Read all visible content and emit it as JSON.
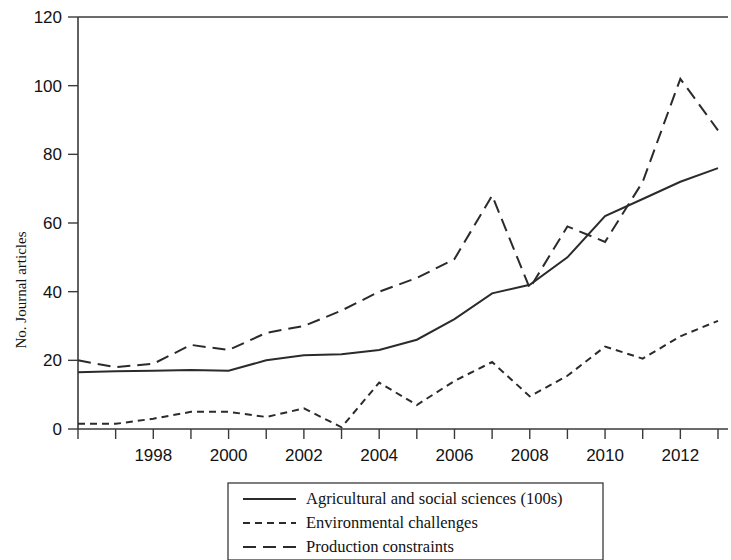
{
  "chart_data": {
    "type": "line",
    "title": "",
    "subtitle": "",
    "xlabel": "",
    "ylabel": "No. Journal articles",
    "xlim": [
      1996,
      2013
    ],
    "ylim": [
      0,
      120
    ],
    "grid": false,
    "legend_position": "bottom-center",
    "y_ticks": [
      0,
      20,
      40,
      60,
      80,
      100,
      120
    ],
    "y_tick_labels": [
      "0",
      "20",
      "40",
      "60",
      "80",
      "100",
      "120"
    ],
    "x_ticks": [
      1996,
      1997,
      1998,
      1999,
      2000,
      2001,
      2002,
      2003,
      2004,
      2005,
      2006,
      2007,
      2008,
      2009,
      2010,
      2011,
      2012,
      2013
    ],
    "x_tick_labels_shown": [
      "1998",
      "2000",
      "2002",
      "2004",
      "2006",
      "2008",
      "2010",
      "2012"
    ],
    "x_tick_labels_shown_values": [
      1998,
      2000,
      2002,
      2004,
      2006,
      2008,
      2010,
      2012
    ],
    "x": [
      1996,
      1997,
      1998,
      1999,
      2000,
      2001,
      2002,
      2003,
      2004,
      2005,
      2006,
      2007,
      2008,
      2009,
      2010,
      2011,
      2012,
      2013
    ],
    "series": [
      {
        "name": "Agricultural and social sciences (100s)",
        "style": "solid",
        "values": [
          16.5,
          16.8,
          17.0,
          17.2,
          17.0,
          20.0,
          21.5,
          21.8,
          23.0,
          26.0,
          32.0,
          39.5,
          42.0,
          50.0,
          62.0,
          67.0,
          72.0,
          76.0
        ]
      },
      {
        "name": "Environmental challenges",
        "style": "short-dash",
        "values": [
          1.5,
          1.5,
          3.0,
          5.0,
          5.0,
          3.5,
          6.0,
          0.5,
          13.5,
          7.0,
          14.0,
          19.5,
          9.5,
          15.5,
          24.0,
          20.5,
          27.0,
          31.5
        ]
      },
      {
        "name": "Production constraints",
        "style": "long-dash",
        "values": [
          20.0,
          18.0,
          19.0,
          24.5,
          23.0,
          28.0,
          30.0,
          34.5,
          40.0,
          44.0,
          49.5,
          68.0,
          41.0,
          59.0,
          54.5,
          72.0,
          102.0,
          87.0
        ]
      }
    ],
    "legend": [
      {
        "label": "Agricultural and social sciences (100s)",
        "style": "solid"
      },
      {
        "label": "Environmental challenges",
        "style": "short-dash"
      },
      {
        "label": "Production constraints",
        "style": "long-dash"
      }
    ],
    "colors": {
      "line": "#2b2b2b",
      "axis": "#3a3a3a",
      "background": "#ffffff"
    }
  }
}
